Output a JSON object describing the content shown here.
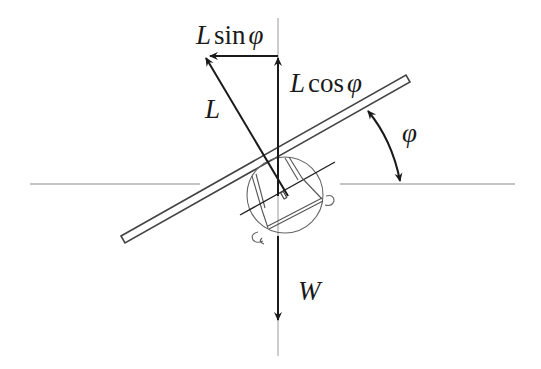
{
  "diagram": {
    "labels": {
      "lift": "L",
      "lift_horizontal": {
        "coef": "L",
        "fn": "sin",
        "var": "φ"
      },
      "lift_vertical": {
        "coef": "L",
        "fn": "cos",
        "var": "φ"
      },
      "weight": "W",
      "bank_angle": "φ"
    },
    "vectors": [
      {
        "name": "lift",
        "label": "L",
        "direction": "perpendicular to wing, tilted left"
      },
      {
        "name": "lift-horizontal-component",
        "label": "L sin φ",
        "direction": "left"
      },
      {
        "name": "lift-vertical-component",
        "label": "L cos φ",
        "direction": "up"
      },
      {
        "name": "weight",
        "label": "W",
        "direction": "down"
      }
    ],
    "colors": {
      "line": "#1a1a1a",
      "reference": "#8a8a8a",
      "aircraft": "#555555"
    }
  }
}
